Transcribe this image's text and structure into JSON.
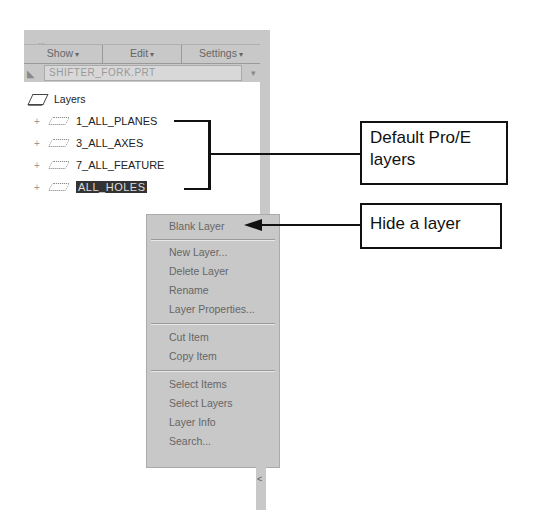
{
  "panel": {
    "tabstrip_text": "...",
    "menubar": [
      {
        "label": "Show",
        "icon": "chevron-down-icon"
      },
      {
        "label": "Edit",
        "icon": "chevron-down-icon"
      },
      {
        "label": "Settings",
        "icon": "chevron-down-icon"
      }
    ],
    "model_selector": {
      "value": "SHIFTER_FORK.PRT",
      "icon": "arrow-pointer-icon",
      "dropdown_icon": "chevron-down-icon"
    },
    "tree": {
      "root": {
        "label": "Layers",
        "icon": "layers-icon"
      },
      "items": [
        {
          "label": "1_ALL_PLANES",
          "expand": "+",
          "icon": "layer-icon"
        },
        {
          "label": "3_ALL_AXES",
          "expand": "+",
          "icon": "layer-icon"
        },
        {
          "label": "7_ALL_FEATURE",
          "expand": "+",
          "icon": "layer-icon"
        },
        {
          "label": "ALL_HOLES",
          "expand": "+",
          "icon": "layer-icon",
          "selected": true
        }
      ]
    }
  },
  "context_menu": {
    "groups": [
      [
        "Blank Layer"
      ],
      [
        "New Layer...",
        "Delete Layer",
        "Rename",
        "Layer Properties..."
      ],
      [
        "Cut Item",
        "Copy Item"
      ],
      [
        "Select Items",
        "Select Layers",
        "Layer Info",
        "Search..."
      ]
    ]
  },
  "callouts": {
    "default_layers": "Default Pro/E layers",
    "hide_layer": "Hide a layer"
  },
  "scroll_glyph": "<"
}
